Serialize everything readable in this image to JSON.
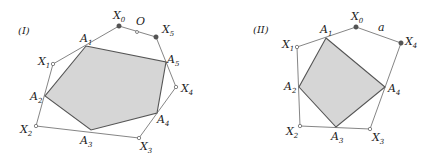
{
  "figures": [
    {
      "id": "I",
      "title": "(I)",
      "outer_polygon": [
        "X0",
        "X5",
        "X4",
        "X3",
        "X2",
        "X1"
      ],
      "inner_polygon": [
        "A1",
        "A5",
        "A4",
        "A3",
        "A2"
      ],
      "edge_label": "O",
      "points": {
        "X0": {
          "label": "X",
          "sub": "0",
          "style": "filled"
        },
        "X1": {
          "label": "X",
          "sub": "1",
          "style": "open"
        },
        "X2": {
          "label": "X",
          "sub": "2",
          "style": "open"
        },
        "X3": {
          "label": "X",
          "sub": "3",
          "style": "open"
        },
        "X4": {
          "label": "X",
          "sub": "4",
          "style": "open"
        },
        "X5": {
          "label": "X",
          "sub": "5",
          "style": "filled"
        },
        "A1": {
          "label": "A",
          "sub": "1"
        },
        "A2": {
          "label": "A",
          "sub": "2"
        },
        "A3": {
          "label": "A",
          "sub": "3"
        },
        "A4": {
          "label": "A",
          "sub": "4"
        },
        "A5": {
          "label": "A",
          "sub": "5"
        },
        "O": {
          "label": "O",
          "style": "open"
        }
      }
    },
    {
      "id": "II",
      "title": "(II)",
      "outer_polygon": [
        "X0",
        "X4",
        "X3",
        "X2",
        "X1"
      ],
      "inner_polygon": [
        "A1",
        "A4",
        "A3",
        "A2"
      ],
      "edge_label": "a",
      "points": {
        "X0": {
          "label": "X",
          "sub": "0",
          "style": "filled"
        },
        "X1": {
          "label": "X",
          "sub": "1",
          "style": "open"
        },
        "X2": {
          "label": "X",
          "sub": "2",
          "style": "open"
        },
        "X3": {
          "label": "X",
          "sub": "3",
          "style": "open"
        },
        "X4": {
          "label": "X",
          "sub": "4",
          "style": "filled"
        },
        "A1": {
          "label": "A",
          "sub": "1"
        },
        "A2": {
          "label": "A",
          "sub": "2"
        },
        "A3": {
          "label": "A",
          "sub": "3"
        },
        "A4": {
          "label": "A",
          "sub": "4"
        }
      }
    }
  ]
}
